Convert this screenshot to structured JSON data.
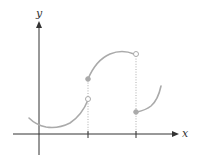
{
  "diagram": {
    "type": "piecewise-function-graph",
    "axes": {
      "x_label": "x",
      "y_label": "y"
    },
    "colors": {
      "axis": "#333333",
      "curve": "#aaaaaa",
      "guide": "#999999"
    },
    "ticks": [
      {
        "id": "tick-a",
        "position": "first discontinuity"
      },
      {
        "id": "tick-b",
        "position": "second discontinuity"
      }
    ],
    "pieces": [
      {
        "id": "piece-1",
        "shape": "concave-up arc, dips below then rises",
        "right_endpoint": "open"
      },
      {
        "id": "piece-2",
        "shape": "concave-down arc rising to a maximum",
        "left_endpoint": "filled",
        "right_endpoint": "open"
      },
      {
        "id": "piece-3",
        "shape": "concave-up arc rising",
        "left_endpoint": "filled"
      }
    ],
    "guides": [
      {
        "id": "guide-a",
        "style": "dotted vertical"
      },
      {
        "id": "guide-b",
        "style": "dotted vertical"
      }
    ]
  }
}
